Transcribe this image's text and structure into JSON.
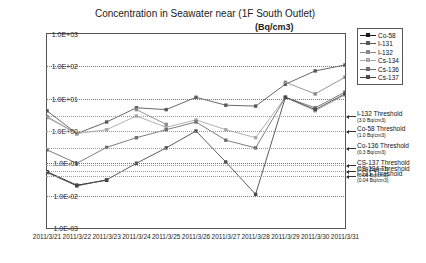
{
  "chart_data": {
    "type": "line",
    "title": "Concentration in Seawater near (1F South Outlet)",
    "unit_label": "(Bq/cm3)",
    "xlabel": "",
    "ylabel": "",
    "log_y": true,
    "ylim": [
      0.001,
      1000
    ],
    "grid": true,
    "legend_position": "top-right",
    "categories": [
      "2011/3/21",
      "2011/3/22",
      "2011/3/23",
      "2011/3/24",
      "2011/3/25",
      "2011/3/26",
      "2011/3/27",
      "2011/3/28",
      "2011/3/29",
      "2011/3/30",
      "2011/3/31"
    ],
    "ytick_labels": [
      "1.0E+03",
      "1.0E+02",
      "1.0E+01",
      "1.0E+00",
      "1.0E-01",
      "1.0E-02",
      "1.0E-03"
    ],
    "ytick_values": [
      1000,
      100,
      10,
      1,
      0.1,
      0.01,
      0.001
    ],
    "series": [
      {
        "name": "Co-58",
        "color": "#1a1a1a",
        "values": [
          0.055,
          0.021,
          0.03,
          null,
          null,
          null,
          null,
          null,
          null,
          null,
          null
        ]
      },
      {
        "name": "I-131",
        "color": "#585858",
        "values": [
          4.2,
          0.83,
          1.9,
          5.2,
          4.6,
          11.0,
          6.3,
          5.9,
          28.0,
          72.0,
          110.0
        ]
      },
      {
        "name": "I-132",
        "color": "#8a8a8a",
        "values": [
          2.8,
          0.83,
          null,
          4.6,
          1.6,
          null,
          null,
          null,
          32.0,
          14.0,
          46.0
        ]
      },
      {
        "name": "Cs-134",
        "color": "#a8a8a8",
        "values": [
          2.6,
          0.83,
          1.1,
          2.9,
          1.3,
          2.2,
          1.1,
          0.62,
          11.0,
          4.2,
          13.0
        ]
      },
      {
        "name": "Cs-136",
        "color": "#6e6e6e",
        "values": [
          0.26,
          0.1,
          0.31,
          0.62,
          1.1,
          1.9,
          0.52,
          0.3,
          11.0,
          5.2,
          16.0
        ]
      },
      {
        "name": "Cs-137",
        "color": "#4a4a4a",
        "values": [
          0.052,
          0.02,
          0.031,
          0.1,
          0.3,
          1.0,
          0.11,
          0.011,
          11.0,
          4.6,
          14.0
        ]
      }
    ],
    "thresholds": [
      {
        "label": "I-132 Threshold",
        "value_text": "(3.0  Bq/cm3)",
        "value": 3.0
      },
      {
        "label": "Co-58 Threshold",
        "value_text": "(1.0  Bq/cm3)",
        "value": 1.0
      },
      {
        "label": "Co-136 Threshold",
        "value_text": "(0.3  Bq/cm3)",
        "value": 0.3
      },
      {
        "label": "CS-137 Threshold",
        "value_text": "(0.09  Bq/cm3)",
        "value": 0.09
      },
      {
        "label": "CS-134 Threshold",
        "value_text": "(0.06  Bq/cm3)",
        "value": 0.06
      },
      {
        "label": "I-131 Threshold",
        "value_text": "(0.04  Bq/cm3)",
        "value": 0.04
      }
    ]
  }
}
